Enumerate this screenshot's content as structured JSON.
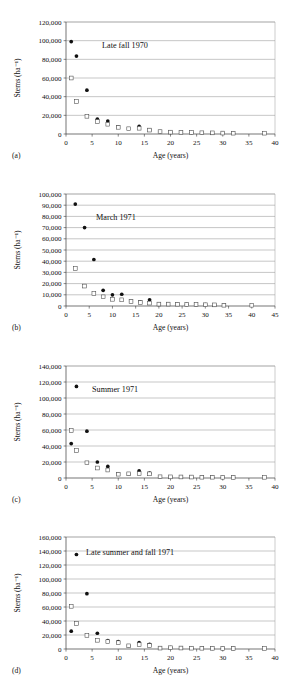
{
  "figure": {
    "axis_titles": {
      "x": "Age (years)",
      "y": "Stems (ha⁻¹)"
    },
    "colors": {
      "grid": "#8c8c8c",
      "axis": "#3a3a3a",
      "filled_marker": "#111111",
      "open_marker": "#ffffff",
      "open_marker_edge": "#444444"
    },
    "panel_labels": [
      "(a)",
      "(b)",
      "(c)",
      "(d)"
    ]
  },
  "chart_data": [
    {
      "type": "scatter",
      "panel": "(a)",
      "title": "Late fall 1970",
      "xlabel": "Age (years)",
      "ylabel": "Stems (ha⁻¹)",
      "xlim": [
        0,
        40
      ],
      "ylim": [
        0,
        120000
      ],
      "xticks": [
        0,
        5,
        10,
        15,
        20,
        25,
        30,
        35,
        40
      ],
      "xticklabels": [
        "0",
        "5",
        "10",
        "15",
        "20",
        "25",
        "30",
        "35",
        "40"
      ],
      "yticks": [
        0,
        20000,
        40000,
        60000,
        80000,
        100000,
        120000
      ],
      "yticklabels": [
        "0",
        "20,000",
        "40,000",
        "60,000",
        "80,000",
        "100,000",
        "120,000"
      ],
      "grid": "horizontal",
      "legend": "none",
      "series": [
        {
          "name": "filled-circle",
          "marker": "filled-circle",
          "x": [
            1,
            2,
            4,
            6,
            8,
            10,
            14,
            16,
            18,
            20,
            22,
            24,
            26,
            28,
            30,
            32
          ],
          "y": [
            99000,
            83500,
            47000,
            16000,
            13800,
            7600,
            8100,
            4400,
            2600,
            2100,
            1900,
            1500,
            1300,
            1100,
            1000,
            900
          ]
        },
        {
          "name": "open-square",
          "marker": "open-square",
          "x": [
            1,
            2,
            4,
            6,
            8,
            10,
            12,
            14,
            16,
            18,
            20,
            22,
            24,
            26,
            28,
            30,
            32,
            38
          ],
          "y": [
            60000,
            34800,
            19000,
            13500,
            10500,
            7200,
            5600,
            6200,
            4200,
            2500,
            2000,
            1800,
            1500,
            1300,
            1200,
            1000,
            900,
            900
          ]
        }
      ]
    },
    {
      "type": "scatter",
      "panel": "(b)",
      "title": "March 1971",
      "xlabel": "Age (years)",
      "ylabel": "Stems (ha⁻¹)",
      "xlim": [
        0,
        45
      ],
      "ylim": [
        0,
        100000
      ],
      "xticks": [
        0,
        5,
        10,
        15,
        20,
        25,
        30,
        35,
        40,
        45
      ],
      "xticklabels": [
        "0",
        "5",
        "10",
        "15",
        "20",
        "25",
        "30",
        "35",
        "40",
        "45"
      ],
      "yticks": [
        0,
        10000,
        20000,
        30000,
        40000,
        50000,
        60000,
        70000,
        80000,
        90000,
        100000
      ],
      "yticklabels": [
        "0",
        "10,000",
        "20,000",
        "30,000",
        "40,000",
        "50,000",
        "60,000",
        "70,000",
        "80,000",
        "90,000",
        "100,000"
      ],
      "grid": "horizontal",
      "legend": "none",
      "series": [
        {
          "name": "filled-circle",
          "marker": "filled-circle",
          "x": [
            2,
            4,
            6,
            8,
            10,
            12,
            14,
            16,
            18,
            20,
            22,
            24,
            26,
            28,
            30,
            32,
            34
          ],
          "y": [
            91000,
            70000,
            41500,
            14000,
            10000,
            10500,
            4200,
            3600,
            5500,
            1700,
            1800,
            1700,
            1500,
            1300,
            1200,
            1000,
            700
          ]
        },
        {
          "name": "open-square",
          "marker": "open-square",
          "x": [
            2,
            4,
            6,
            8,
            10,
            12,
            14,
            16,
            18,
            20,
            22,
            24,
            26,
            28,
            30,
            32,
            34,
            40
          ],
          "y": [
            33500,
            17800,
            11200,
            8200,
            6000,
            5500,
            4000,
            3200,
            2600,
            1700,
            1700,
            1600,
            1400,
            1300,
            1100,
            1000,
            700,
            700
          ]
        }
      ]
    },
    {
      "type": "scatter",
      "panel": "(c)",
      "title": "Summer 1971",
      "xlabel": "Age (years)",
      "ylabel": "Stems (ha⁻¹)",
      "xlim": [
        0,
        40
      ],
      "ylim": [
        0,
        140000
      ],
      "xticks": [
        0,
        5,
        10,
        15,
        20,
        25,
        30,
        35,
        40
      ],
      "xticklabels": [
        "0",
        "5",
        "10",
        "15",
        "20",
        "25",
        "30",
        "35",
        "40"
      ],
      "yticks": [
        0,
        20000,
        40000,
        60000,
        80000,
        100000,
        120000,
        140000
      ],
      "yticklabels": [
        "0",
        "20,000",
        "40,000",
        "60,000",
        "80,000",
        "100,000",
        "120,000",
        "140,000"
      ],
      "grid": "horizontal",
      "legend": "none",
      "series": [
        {
          "name": "filled-circle",
          "marker": "filled-circle",
          "x": [
            1,
            2,
            4,
            6,
            8,
            10,
            12,
            14,
            16,
            18,
            20,
            22,
            24,
            26,
            28,
            30,
            32
          ],
          "y": [
            43000,
            114500,
            58500,
            20000,
            14500,
            5200,
            5000,
            9000,
            6000,
            1400,
            1500,
            1400,
            1200,
            1100,
            1000,
            900,
            800
          ]
        },
        {
          "name": "open-square",
          "marker": "open-square",
          "x": [
            1,
            2,
            4,
            6,
            8,
            10,
            12,
            14,
            16,
            18,
            20,
            22,
            24,
            26,
            28,
            30,
            32,
            38
          ],
          "y": [
            59500,
            34500,
            19000,
            12500,
            10000,
            4800,
            5200,
            5500,
            5200,
            1500,
            1400,
            1300,
            1200,
            1000,
            1000,
            900,
            800,
            900
          ]
        }
      ]
    },
    {
      "type": "scatter",
      "panel": "(d)",
      "title": "Late summer and fall 1971",
      "xlabel": "Age (years)",
      "ylabel": "Stems (ha⁻¹)",
      "xlim": [
        0,
        40
      ],
      "ylim": [
        0,
        160000
      ],
      "xticks": [
        0,
        5,
        10,
        15,
        20,
        25,
        30,
        35,
        40
      ],
      "xticklabels": [
        "0",
        "5",
        "10",
        "15",
        "20",
        "25",
        "30",
        "35",
        "40"
      ],
      "yticks": [
        0,
        20000,
        40000,
        60000,
        80000,
        100000,
        120000,
        140000,
        160000
      ],
      "yticklabels": [
        "0",
        "20,000",
        "40,000",
        "60,000",
        "80,000",
        "100,000",
        "120,000",
        "140,000",
        "160,000"
      ],
      "grid": "horizontal",
      "legend": "none",
      "series": [
        {
          "name": "filled-circle",
          "marker": "filled-circle",
          "x": [
            1,
            2,
            4,
            6,
            8,
            10,
            12,
            14,
            16,
            18,
            20,
            22,
            24,
            26,
            28,
            30,
            32
          ],
          "y": [
            25500,
            135000,
            79000,
            22500,
            12000,
            10500,
            4500,
            9000,
            6500,
            1200,
            2000,
            1500,
            1200,
            1200,
            1000,
            900,
            800
          ]
        },
        {
          "name": "open-square",
          "marker": "open-square",
          "x": [
            1,
            2,
            4,
            6,
            8,
            10,
            12,
            14,
            16,
            18,
            20,
            22,
            24,
            26,
            28,
            30,
            32,
            38
          ],
          "y": [
            61000,
            36500,
            19500,
            12500,
            10500,
            9000,
            4500,
            6500,
            5000,
            1300,
            1800,
            1400,
            1200,
            1100,
            1000,
            900,
            800,
            900
          ]
        }
      ]
    }
  ]
}
